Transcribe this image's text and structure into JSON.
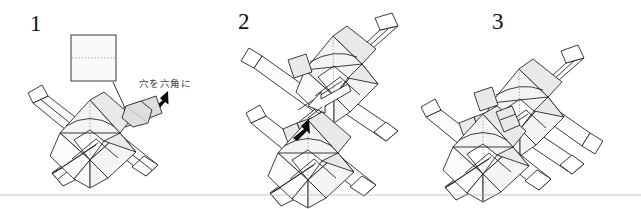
{
  "figure": {
    "type": "origami-instruction-diagram",
    "panel_count": 3,
    "background_color": "#ffffff",
    "ink_color": "#1b1b1b",
    "shade_color": "#f0f0f0",
    "baseline_rule_color": "#b9b9b9"
  },
  "panels": [
    {
      "id": "panel-1",
      "number": "1",
      "description": "A square sheet with a dotted center crease is shown above a completed module; a thin leader line points from the square down to the module's flap, and a bold black arrow points at the hexagonal hole."
    },
    {
      "id": "panel-2",
      "number": "2",
      "description": "Two modules approach each other; a hollow push arrow and a solid black arrow indicate inserting the tab of the upper module into the hexagonal hole of the lower module."
    },
    {
      "id": "panel-3",
      "number": "3",
      "description": "The two modules are joined together, forming a connected pair."
    }
  ],
  "annotations": [
    {
      "id": "annotation-hex",
      "text": "穴を六角に",
      "meaning": "make the hole hexagonal",
      "points_to": "hexagonal hole on the module in panel 1",
      "color": "#3a3a3a"
    }
  ],
  "markers": {
    "paper_square_label": "square sheet with center crease",
    "thin_leader_label": "leader line from square to flap",
    "black_arrow_1_label": "pointer arrow to hexagonal hole",
    "hollow_arrow_label": "insert / push arrow",
    "black_arrow_2_label": "pointer arrow to insertion tab"
  }
}
